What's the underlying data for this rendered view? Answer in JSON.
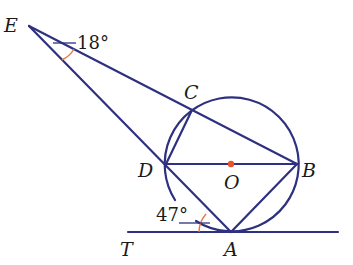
{
  "diagram": {
    "type": "geometry",
    "colors": {
      "line": "#2e3080",
      "angle_mark": "#e8734a",
      "center_dot": "#e8552a",
      "text": "#1a1a1a"
    },
    "points": {
      "E": {
        "label": "E",
        "x": 29,
        "y": 26
      },
      "C": {
        "label": "C",
        "x": 192,
        "y": 110
      },
      "D": {
        "label": "D",
        "x": 166,
        "y": 164
      },
      "O": {
        "label": "O",
        "x": 231,
        "y": 164
      },
      "B": {
        "label": "B",
        "x": 297,
        "y": 164
      },
      "A": {
        "label": "A",
        "x": 231,
        "y": 232
      },
      "T": {
        "label": "T",
        "x": 128,
        "y": 232
      }
    },
    "circle": {
      "center": "O",
      "radius": 67
    },
    "segments": [
      "E-B",
      "E-A",
      "C-D",
      "D-B",
      "B-A",
      "T-A tangent line"
    ],
    "angles": [
      {
        "vertex": "E",
        "label": "18°",
        "between": [
          "ED",
          "EB"
        ]
      },
      {
        "vertex": "A",
        "label": "47°",
        "between": [
          "AD",
          "AT"
        ]
      }
    ]
  }
}
